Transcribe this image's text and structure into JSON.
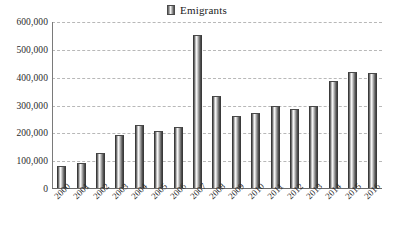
{
  "legend": {
    "swatch_name": "series-swatch",
    "label": "Emigrants"
  },
  "chart_data": {
    "type": "bar",
    "title": "Emigrants",
    "xlabel": "",
    "ylabel": "",
    "categories": [
      "2000",
      "2001",
      "2002",
      "2003",
      "2004",
      "2005",
      "2006",
      "2007",
      "2008",
      "2009",
      "2010",
      "2011",
      "2012",
      "2013",
      "2014",
      "2015",
      "2016"
    ],
    "values": [
      80000,
      90000,
      125000,
      190000,
      225000,
      205000,
      220000,
      550000,
      330000,
      260000,
      270000,
      295000,
      285000,
      295000,
      385000,
      417000,
      415000
    ],
    "series": [
      {
        "name": "Emigrants",
        "values": [
          80000,
          90000,
          125000,
          190000,
          225000,
          205000,
          220000,
          550000,
          330000,
          260000,
          270000,
          295000,
          285000,
          295000,
          385000,
          417000,
          415000
        ]
      }
    ],
    "ylim": [
      0,
      600000
    ],
    "ytick_values": [
      0,
      100000,
      200000,
      300000,
      400000,
      500000,
      600000
    ],
    "ytick_labels": [
      "0",
      "100,000",
      "200,000",
      "300,000",
      "400,000",
      "500,000",
      "600,000"
    ],
    "grid": true,
    "grid_style": "dashed-horizontal",
    "legend_position": "top-center",
    "bar_style": "cylinder-gradient",
    "colors": {
      "bar_light": "#fbfbfb",
      "bar_dark": "#3c3c3c",
      "gridline": "#b8b8b8",
      "axis": "#6a6a6a",
      "text": "#2b2b2b",
      "background": "#ffffff"
    }
  }
}
